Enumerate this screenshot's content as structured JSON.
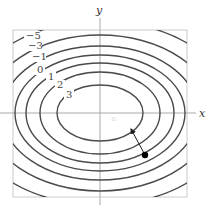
{
  "diagram": {
    "type": "contour-plot",
    "axes": {
      "x_label": "x",
      "y_label": "y"
    },
    "box": {
      "left": 13,
      "top": 30,
      "right": 187,
      "bottom": 197
    },
    "center": {
      "x": 100,
      "y": 113
    },
    "contours": [
      {
        "level": "−5",
        "rx": 134,
        "ry": 92
      },
      {
        "level": "−3",
        "rx": 114,
        "ry": 78
      },
      {
        "level": "−1",
        "rx": 98,
        "ry": 67
      },
      {
        "level": "0",
        "rx": 85,
        "ry": 58
      },
      {
        "level": "1",
        "rx": 74,
        "ry": 50
      },
      {
        "level": "2",
        "rx": 60,
        "ry": 41
      },
      {
        "level": "3",
        "rx": 43,
        "ry": 28
      }
    ],
    "contour_labels": [
      {
        "text": "−5",
        "x": 26,
        "y": 39
      },
      {
        "text": "−3",
        "x": 28,
        "y": 49
      },
      {
        "text": "−1",
        "x": 32,
        "y": 60
      },
      {
        "text": "0",
        "x": 37,
        "y": 73
      },
      {
        "text": "1",
        "x": 48,
        "y": 80
      },
      {
        "text": "2",
        "x": 57,
        "y": 88
      },
      {
        "text": "3",
        "x": 66,
        "y": 98
      }
    ],
    "faint_center_label": "n",
    "point": {
      "x": 145,
      "y": 155
    },
    "arrow_tip": {
      "x": 131,
      "y": 129
    },
    "colors": {
      "contour": "#4a4a4a",
      "axis": "#aaaaaa",
      "box": "#cccccc",
      "point": "#000000"
    }
  }
}
